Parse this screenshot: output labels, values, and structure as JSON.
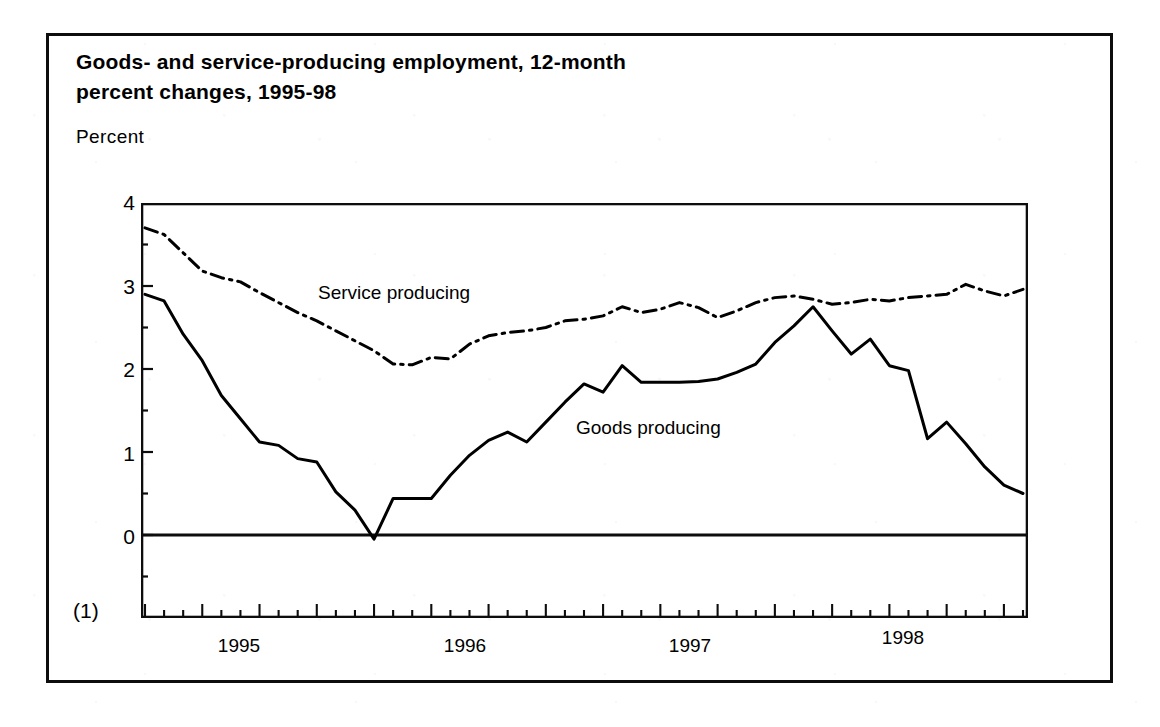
{
  "figure": {
    "title": "Goods- and service-producing employment, 12-month\npercent changes, 1995-98",
    "y_axis_caption": "Percent",
    "below_axis_label": "(1)",
    "line_color": "#000000",
    "frame_color": "#0d0d0d"
  },
  "annotations": {
    "service_label": "Service producing",
    "goods_label": "Goods producing"
  },
  "chart_data": {
    "type": "line",
    "title": "Goods- and service-producing employment, 12-month percent changes, 1995-98",
    "xlabel": "",
    "ylabel": "Percent",
    "ylim": [
      -1,
      4
    ],
    "xlim": [
      "1995-01",
      "1998-11"
    ],
    "grid": false,
    "legend": "inline-annotations",
    "y_ticks": [
      "4",
      "3",
      "2",
      "1",
      "0",
      "(1)"
    ],
    "y_tick_values": [
      4,
      3,
      2,
      1,
      0,
      -1
    ],
    "x_ticks": [
      "1995",
      "1996",
      "1997",
      "1998"
    ],
    "x_tick_values": [
      1995,
      1996,
      1997,
      1998
    ],
    "x_minor_ticks": "monthly",
    "x": [
      "1995-01",
      "1995-02",
      "1995-03",
      "1995-04",
      "1995-05",
      "1995-06",
      "1995-07",
      "1995-08",
      "1995-09",
      "1995-10",
      "1995-11",
      "1995-12",
      "1996-01",
      "1996-02",
      "1996-03",
      "1996-04",
      "1996-05",
      "1996-06",
      "1996-07",
      "1996-08",
      "1996-09",
      "1996-10",
      "1996-11",
      "1996-12",
      "1997-01",
      "1997-02",
      "1997-03",
      "1997-04",
      "1997-05",
      "1997-06",
      "1997-07",
      "1997-08",
      "1997-09",
      "1997-10",
      "1997-11",
      "1997-12",
      "1998-01",
      "1998-02",
      "1998-03",
      "1998-04",
      "1998-05",
      "1998-06",
      "1998-07",
      "1998-08",
      "1998-09",
      "1998-10",
      "1998-11"
    ],
    "series": [
      {
        "name": "Service producing",
        "style": "dash-dot",
        "values": [
          3.7,
          3.62,
          3.4,
          3.18,
          3.1,
          3.05,
          2.92,
          2.8,
          2.68,
          2.58,
          2.46,
          2.34,
          2.22,
          2.06,
          2.05,
          2.14,
          2.12,
          2.3,
          2.4,
          2.44,
          2.46,
          2.5,
          2.58,
          2.6,
          2.64,
          2.75,
          2.68,
          2.72,
          2.8,
          2.74,
          2.62,
          2.7,
          2.8,
          2.86,
          2.88,
          2.84,
          2.78,
          2.8,
          2.84,
          2.82,
          2.86,
          2.88,
          2.9,
          3.02,
          2.94,
          2.88,
          2.96
        ]
      },
      {
        "name": "Goods producing",
        "style": "solid",
        "values": [
          2.9,
          2.82,
          2.42,
          2.1,
          1.68,
          1.4,
          1.12,
          1.08,
          0.92,
          0.88,
          0.52,
          0.3,
          -0.05,
          0.44,
          0.44,
          0.44,
          0.72,
          0.96,
          1.14,
          1.24,
          1.12,
          1.36,
          1.6,
          1.82,
          1.72,
          2.04,
          1.84,
          1.84,
          1.84,
          1.85,
          1.88,
          1.96,
          2.06,
          2.32,
          2.52,
          2.75,
          2.46,
          2.18,
          2.36,
          2.04,
          1.98,
          1.16,
          1.36,
          1.1,
          0.82,
          0.6,
          0.5
        ]
      }
    ]
  }
}
